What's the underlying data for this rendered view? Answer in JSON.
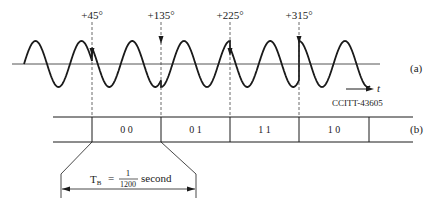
{
  "figure": {
    "phase_labels": [
      {
        "text": "+45°",
        "x": 92
      },
      {
        "text": "+135°",
        "x": 161
      },
      {
        "text": "+225°",
        "x": 230
      },
      {
        "text": "+315°",
        "x": 299
      }
    ],
    "panel_a_label": "(a)",
    "panel_b_label": "(b)",
    "time_axis_label": "t",
    "source_label": "CCITT-43605",
    "dibits": [
      "0 0",
      "0 1",
      "1 1",
      "1 0"
    ],
    "tb_label": {
      "symbol": "T",
      "subscript": "B",
      "equals": "=",
      "numerator": "1",
      "denominator": "1200",
      "unit": "second"
    }
  },
  "colors": {
    "ink": "#1a1a1a",
    "axis": "#555555",
    "dash": "#444444"
  }
}
